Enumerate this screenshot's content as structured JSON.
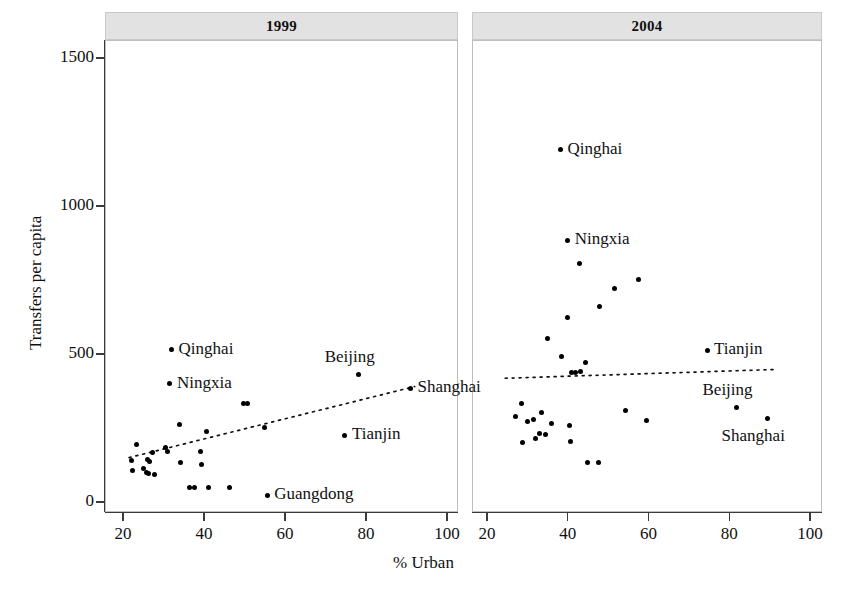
{
  "figure": {
    "y_axis_title": "Transfers per capita",
    "x_axis_title": "% Urban",
    "y_ticks": [
      "0",
      "500",
      "1000",
      "1500"
    ],
    "x_ticks": [
      "20",
      "40",
      "60",
      "80",
      "100"
    ]
  },
  "chart_data": {
    "type": "scatter",
    "title": "",
    "xlabel": "% Urban",
    "ylabel": "Transfers per capita",
    "xlim": [
      18,
      102
    ],
    "ylim": [
      -40,
      1560
    ],
    "xticks": [
      20,
      40,
      60,
      80,
      100
    ],
    "yticks": [
      0,
      500,
      1000,
      1500
    ],
    "grid": false,
    "legend": "none",
    "panels": [
      {
        "name": "1999",
        "label": "1999",
        "points": [
          {
            "x": 32.0,
            "y": 515,
            "label": "Qinghai",
            "label_pos": "right"
          },
          {
            "x": 31.6,
            "y": 400,
            "label": "Ningxia",
            "label_pos": "right"
          },
          {
            "x": 78.2,
            "y": 432,
            "label": "Beijing",
            "label_pos": "above"
          },
          {
            "x": 91.0,
            "y": 385,
            "label": "Shanghai",
            "label_pos": "right"
          },
          {
            "x": 74.8,
            "y": 225,
            "label": "Tianjin",
            "label_pos": "right"
          },
          {
            "x": 55.6,
            "y": 22,
            "label": "Guangdong",
            "label_pos": "right"
          },
          {
            "x": 49.8,
            "y": 333,
            "label": "",
            "label_pos": ""
          },
          {
            "x": 50.7,
            "y": 333,
            "label": "",
            "label_pos": ""
          },
          {
            "x": 34.0,
            "y": 263,
            "label": "",
            "label_pos": ""
          },
          {
            "x": 40.7,
            "y": 237,
            "label": "",
            "label_pos": ""
          },
          {
            "x": 55.0,
            "y": 253,
            "label": "",
            "label_pos": ""
          },
          {
            "x": 23.4,
            "y": 195,
            "label": "",
            "label_pos": ""
          },
          {
            "x": 30.4,
            "y": 185,
            "label": "",
            "label_pos": ""
          },
          {
            "x": 31.0,
            "y": 172,
            "label": "",
            "label_pos": ""
          },
          {
            "x": 39.2,
            "y": 172,
            "label": "",
            "label_pos": ""
          },
          {
            "x": 27.2,
            "y": 167,
            "label": "",
            "label_pos": ""
          },
          {
            "x": 22.1,
            "y": 140,
            "label": "",
            "label_pos": ""
          },
          {
            "x": 26.0,
            "y": 145,
            "label": "",
            "label_pos": ""
          },
          {
            "x": 26.5,
            "y": 137,
            "label": "",
            "label_pos": ""
          },
          {
            "x": 34.2,
            "y": 133,
            "label": "",
            "label_pos": ""
          },
          {
            "x": 39.3,
            "y": 128,
            "label": "",
            "label_pos": ""
          },
          {
            "x": 22.3,
            "y": 108,
            "label": "",
            "label_pos": ""
          },
          {
            "x": 25.0,
            "y": 112,
            "label": "",
            "label_pos": ""
          },
          {
            "x": 25.7,
            "y": 100,
            "label": "",
            "label_pos": ""
          },
          {
            "x": 26.4,
            "y": 96,
            "label": "",
            "label_pos": ""
          },
          {
            "x": 27.8,
            "y": 93,
            "label": "",
            "label_pos": ""
          },
          {
            "x": 36.3,
            "y": 50,
            "label": "",
            "label_pos": ""
          },
          {
            "x": 37.6,
            "y": 50,
            "label": "",
            "label_pos": ""
          },
          {
            "x": 41.0,
            "y": 50,
            "label": "",
            "label_pos": ""
          },
          {
            "x": 46.4,
            "y": 48,
            "label": "",
            "label_pos": ""
          }
        ],
        "trend": {
          "x0": 21.5,
          "y0": 150,
          "x1": 92.0,
          "y1": 390
        }
      },
      {
        "name": "2004",
        "label": "2004",
        "points": [
          {
            "x": 38.2,
            "y": 1190,
            "label": "Qinghai",
            "label_pos": "right"
          },
          {
            "x": 40.0,
            "y": 885,
            "label": "Ningxia",
            "label_pos": "right"
          },
          {
            "x": 43.0,
            "y": 805,
            "label": "",
            "label_pos": ""
          },
          {
            "x": 51.5,
            "y": 720,
            "label": "",
            "label_pos": ""
          },
          {
            "x": 57.5,
            "y": 752,
            "label": "",
            "label_pos": ""
          },
          {
            "x": 47.8,
            "y": 660,
            "label": "",
            "label_pos": ""
          },
          {
            "x": 40.0,
            "y": 625,
            "label": "",
            "label_pos": ""
          },
          {
            "x": 35.0,
            "y": 553,
            "label": "",
            "label_pos": ""
          },
          {
            "x": 74.5,
            "y": 512,
            "label": "Tianjin",
            "label_pos": "right"
          },
          {
            "x": 81.8,
            "y": 320,
            "label": "Beijing",
            "label_pos": "above"
          },
          {
            "x": 89.5,
            "y": 283,
            "label": "Shanghai",
            "label_pos": "below"
          },
          {
            "x": 38.5,
            "y": 492,
            "label": "",
            "label_pos": ""
          },
          {
            "x": 44.5,
            "y": 470,
            "label": "",
            "label_pos": ""
          },
          {
            "x": 41.0,
            "y": 437,
            "label": "",
            "label_pos": ""
          },
          {
            "x": 42.0,
            "y": 437,
            "label": "",
            "label_pos": ""
          },
          {
            "x": 43.2,
            "y": 440,
            "label": "",
            "label_pos": ""
          },
          {
            "x": 28.5,
            "y": 332,
            "label": "",
            "label_pos": ""
          },
          {
            "x": 27.0,
            "y": 290,
            "label": "",
            "label_pos": ""
          },
          {
            "x": 33.5,
            "y": 302,
            "label": "",
            "label_pos": ""
          },
          {
            "x": 31.5,
            "y": 278,
            "label": "",
            "label_pos": ""
          },
          {
            "x": 54.4,
            "y": 308,
            "label": "",
            "label_pos": ""
          },
          {
            "x": 59.5,
            "y": 277,
            "label": "",
            "label_pos": ""
          },
          {
            "x": 30.0,
            "y": 272,
            "label": "",
            "label_pos": ""
          },
          {
            "x": 40.5,
            "y": 258,
            "label": "",
            "label_pos": ""
          },
          {
            "x": 36.0,
            "y": 265,
            "label": "",
            "label_pos": ""
          },
          {
            "x": 33.0,
            "y": 232,
            "label": "",
            "label_pos": ""
          },
          {
            "x": 34.5,
            "y": 228,
            "label": "",
            "label_pos": ""
          },
          {
            "x": 32.0,
            "y": 215,
            "label": "",
            "label_pos": ""
          },
          {
            "x": 28.8,
            "y": 200,
            "label": "",
            "label_pos": ""
          },
          {
            "x": 40.6,
            "y": 203,
            "label": "",
            "label_pos": ""
          },
          {
            "x": 44.8,
            "y": 132,
            "label": "",
            "label_pos": ""
          },
          {
            "x": 47.6,
            "y": 132,
            "label": "",
            "label_pos": ""
          }
        ],
        "trend": {
          "x0": 24.5,
          "y0": 418,
          "x1": 92.0,
          "y1": 448
        }
      }
    ]
  }
}
